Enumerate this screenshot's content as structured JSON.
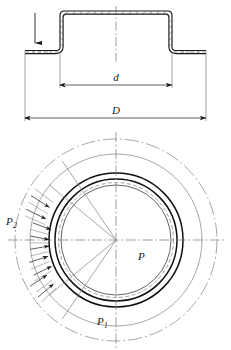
{
  "figure": {
    "type": "engineering-drawing",
    "views": [
      {
        "name": "section-view",
        "position": "top"
      },
      {
        "name": "plan-view",
        "position": "bottom"
      }
    ]
  },
  "labels": {
    "inner_diameter": "d",
    "outer_diameter": "D",
    "pressure_center": "P",
    "pressure_bottom_main": "P",
    "pressure_bottom_sub": "1",
    "pressure_left_main": "P",
    "pressure_left_sub": "2"
  },
  "annotations": {
    "force_arrow": "down-arrow-icon",
    "pressure_arrows": "radial-inward-arrows",
    "pressure_arrow_count": 9,
    "centerline": "dash-dot-centerline",
    "hatching": "section-hatching"
  },
  "colors": {
    "line": "#1a1a1a",
    "thin_line": "#555555",
    "centerline": "#777777",
    "background": "#ffffff"
  },
  "geometry": {
    "section": {
      "flange_left_x": 25,
      "flange_right_x": 206,
      "wall_left_x": 60,
      "wall_right_x": 172,
      "top_y": 11,
      "flange_y": 53,
      "wall_thickness": 3
    },
    "dimension_d": {
      "x1": 60,
      "x2": 172,
      "y": 85
    },
    "dimension_D": {
      "x1": 25,
      "x2": 206,
      "y": 118
    },
    "plan": {
      "center_x": 116,
      "center_y": 240,
      "r_outer_dashdot": 101,
      "r_pressure_outer": 86,
      "r_ring_outer": 67,
      "r_ring_inner": 61,
      "r_dashed": 57,
      "r_inner": 55
    }
  }
}
